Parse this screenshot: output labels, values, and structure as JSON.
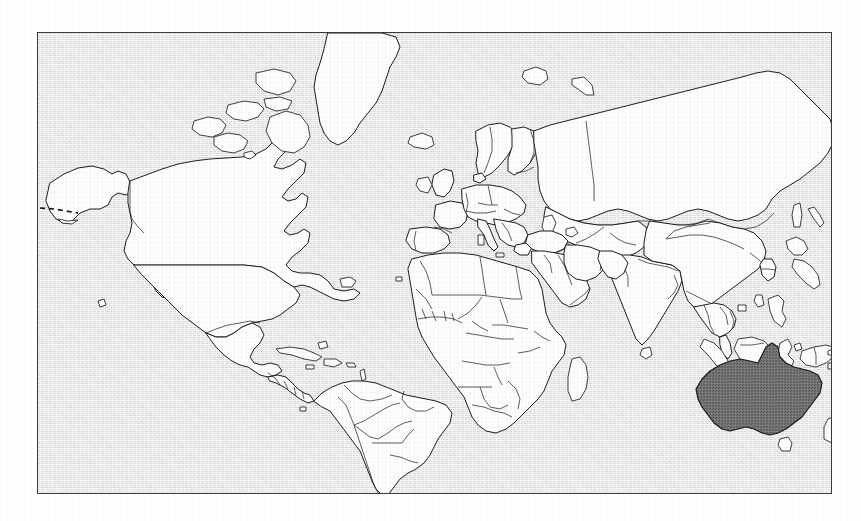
{
  "figure": {
    "type": "world-map",
    "caption": "",
    "projection": "equirectangular",
    "title": "",
    "background_color": "#fefefe",
    "frame": {
      "border_color": "#3a3a3a",
      "x": 37,
      "y": 32,
      "width": 795,
      "height": 462
    },
    "ocean": {
      "label": "ocean",
      "fill_color": "#dddddd",
      "texture": "stipple-dither"
    },
    "land": {
      "label": "land",
      "fill_color": "#ffffff",
      "outline_color": "#1d1d1d"
    },
    "country_borders": {
      "label": "country borders",
      "stroke_color": "#2a2a2a",
      "visible": true
    },
    "highlight": {
      "label": "Australia",
      "country": "Australia",
      "fill_color": "#6e6e6e",
      "outline_color": "#161616",
      "texture": "stipple-dither"
    },
    "dashed_line": {
      "label": "maritime boundary",
      "stroke_color": "#141414",
      "style": "dashed"
    },
    "legend": {
      "visible": false,
      "items": [
        {
          "label": "Australia",
          "color": "#6e6e6e"
        },
        {
          "label": "Other countries",
          "color": "#ffffff"
        },
        {
          "label": "Ocean",
          "color": "#dddddd"
        }
      ]
    },
    "regions_shown": [
      "North America",
      "South America",
      "Greenland",
      "Europe",
      "Africa",
      "Asia",
      "Russia",
      "Middle East",
      "India",
      "Southeast Asia",
      "Indonesia",
      "Philippines",
      "Japan",
      "Papua New Guinea",
      "Australia",
      "New Zealand",
      "Madagascar",
      "Iceland",
      "British Isles",
      "Svalbard",
      "Sri Lanka",
      "Tasmania"
    ],
    "regions_omitted": [
      "Antarctica"
    ],
    "accessible_description": "Outline world map with country borders; Australia is shaded dark gray while all other landmasses are white on a light gray stippled ocean."
  }
}
